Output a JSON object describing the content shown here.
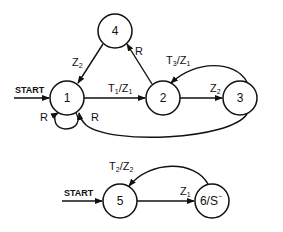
{
  "diagram": {
    "type": "state-transition",
    "colors": {
      "ink": "#111111",
      "background": "#ffffff"
    },
    "machine_a": {
      "start_label": "START",
      "states": [
        {
          "id": "1",
          "label": "1"
        },
        {
          "id": "2",
          "label": "2"
        },
        {
          "id": "3",
          "label": "3"
        },
        {
          "id": "4",
          "label": "4"
        }
      ],
      "transitions": [
        {
          "from": "1",
          "to": "2",
          "label": "T",
          "sub": "1",
          "label2": "/Z",
          "sub2": "1"
        },
        {
          "from": "2",
          "to": "3",
          "label": "Z",
          "sub": "2"
        },
        {
          "from": "3",
          "to": "2",
          "label": "T",
          "sub": "3",
          "label2": "/Z",
          "sub2": "1"
        },
        {
          "from": "2",
          "to": "4",
          "label": "R"
        },
        {
          "from": "4",
          "to": "1",
          "label": "Z",
          "sub": "2"
        },
        {
          "from": "1",
          "to": "1",
          "label": "R"
        },
        {
          "from": "3",
          "to": "1",
          "label": "R"
        }
      ]
    },
    "machine_b": {
      "start_label": "START",
      "states": [
        {
          "id": "5",
          "label": "5"
        },
        {
          "id": "6",
          "label": "6/S",
          "sup": "−"
        }
      ],
      "transitions": [
        {
          "from": "5",
          "to": "6",
          "label": "Z",
          "sub": "1"
        },
        {
          "from": "6",
          "to": "5",
          "label": "T",
          "sub": "2",
          "label2": "/Z",
          "sub2": "2"
        }
      ]
    }
  }
}
